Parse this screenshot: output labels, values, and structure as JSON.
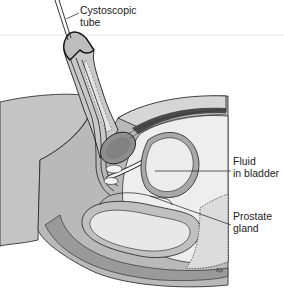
{
  "figure": {
    "type": "anatomical-cross-section"
  },
  "labels": {
    "tube": {
      "line1": "Cystoscopic",
      "line2": "tube"
    },
    "fluid": {
      "line1": "Fluid",
      "line2": "in bladder"
    },
    "prostate": {
      "line1": "Prostate",
      "line2": "gland"
    }
  },
  "colors": {
    "body_gray": "#b9b9b9",
    "light_gray": "#d6d6d6",
    "bladder_fill": "#ececec",
    "outline": "#1e1e1e",
    "dark_band": "#555555",
    "background": "#ffffff"
  }
}
